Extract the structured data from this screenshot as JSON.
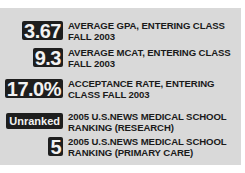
{
  "stats": [
    {
      "value": "3.67",
      "label_line1": "AVERAGE GPA, ENTERING CLASS",
      "label_line2": "FALL 2003"
    },
    {
      "value": "9.3",
      "label_line1": "AVERAGE MCAT, ENTERING CLASS",
      "label_line2": "FALL 2003"
    },
    {
      "value": "17.0%",
      "label_line1": "ACCEPTANCE RATE, ENTERING",
      "label_line2": "CLASS FALL 2003"
    },
    {
      "value": "Unranked",
      "label_line1": "2005 U.S.NEWS MEDICAL SCHOOL",
      "label_line2": "RANKING (RESEARCH)"
    },
    {
      "value": "5",
      "label_line1": "2005 U.S.NEWS MEDICAL SCHOOL",
      "label_line2": "RANKING (PRIMARY CARE)"
    }
  ],
  "colors": {
    "panel_bg": "#d9d9d9",
    "badge_bg": "#1e1e1e",
    "badge_text": "#f2f2f2",
    "label_text": "#1a1a1a"
  }
}
